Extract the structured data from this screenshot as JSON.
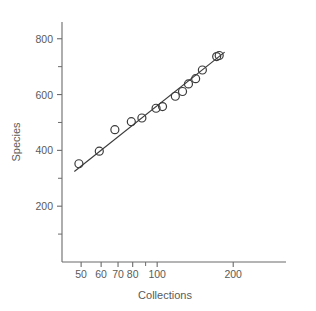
{
  "chart_data": {
    "type": "scatter",
    "title": "",
    "xlabel": "Collections",
    "ylabel": "Species",
    "xscale": "log",
    "yscale": "linear",
    "xlim": [
      42,
      260
    ],
    "ylim": [
      0,
      860
    ],
    "grid": false,
    "legend": null,
    "x_ticks_major": [
      50,
      60,
      70,
      80,
      100,
      200
    ],
    "x_tick_labels": [
      "50",
      "60",
      "70",
      "80",
      "100",
      "200"
    ],
    "x_ticks_minor": [
      90
    ],
    "y_ticks_major": [
      200,
      400,
      600,
      800
    ],
    "y_tick_labels": [
      "200",
      "400",
      "600",
      "800"
    ],
    "y_ticks_minor": [
      100,
      300,
      500,
      700
    ],
    "points": [
      {
        "x": 49,
        "y": 352
      },
      {
        "x": 59,
        "y": 397
      },
      {
        "x": 68,
        "y": 474
      },
      {
        "x": 79,
        "y": 503
      },
      {
        "x": 87,
        "y": 516
      },
      {
        "x": 99,
        "y": 551
      },
      {
        "x": 105,
        "y": 557
      },
      {
        "x": 118,
        "y": 594
      },
      {
        "x": 126,
        "y": 611
      },
      {
        "x": 133,
        "y": 638
      },
      {
        "x": 142,
        "y": 657
      },
      {
        "x": 151,
        "y": 688
      },
      {
        "x": 172,
        "y": 736
      },
      {
        "x": 176,
        "y": 740
      }
    ],
    "fit_line": {
      "label": "regression-line",
      "x_start": 47,
      "y_start": 324,
      "x_end": 185,
      "y_end": 752
    },
    "marker_style": {
      "shape": "open-circle",
      "radius_px": 4,
      "color": "#3b3b3b"
    },
    "line_color": "#3b3b3b",
    "axis_color": "#6b6b6b",
    "background": "#ffffff"
  },
  "labels": {
    "x_axis_title": "Collections",
    "y_axis_title": "Species"
  }
}
